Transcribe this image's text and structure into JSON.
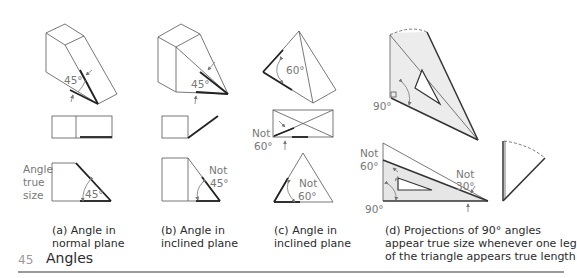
{
  "figure": {
    "number": "45",
    "title": "Angles",
    "panels": [
      {
        "id": "a",
        "caption_line1": "(a) Angle in",
        "caption_line2": "normal plane",
        "angle_label": "45°",
        "side_label_1": "Angle",
        "side_label_2": "true",
        "side_label_3": "size",
        "true_view_angle": "45°"
      },
      {
        "id": "b",
        "caption_line1": "(b) Angle in",
        "caption_line2": "inclined plane",
        "angle_label": "45°",
        "not_label_1": "Not",
        "not_label_2": "45°"
      },
      {
        "id": "c",
        "caption_line1": "(c) Angle in",
        "caption_line2": "inclined plane",
        "angle_label": "60°",
        "not_label_top_1": "Not",
        "not_label_top_2": "60°",
        "not_label_bottom_1": "Not",
        "not_label_bottom_2": "60°"
      },
      {
        "id": "d",
        "caption_line1": "(d) Projections of 90° angles",
        "caption_line2": "appear true size whenever one leg",
        "caption_line3": "of the triangle appears true length",
        "angle_label_top": "90°",
        "not_label_left_1": "Not",
        "not_label_left_2": "60°",
        "angle_label_bottom": "90°",
        "not_label_right_1": "Not",
        "not_label_right_2": "30°"
      }
    ]
  },
  "colors": {
    "line": "#333333",
    "thin_line": "#555555",
    "arrow": "#777777",
    "fill_gray": "#e6e6e6",
    "label_gray": "#777777",
    "rule": "#9a9a9a"
  }
}
